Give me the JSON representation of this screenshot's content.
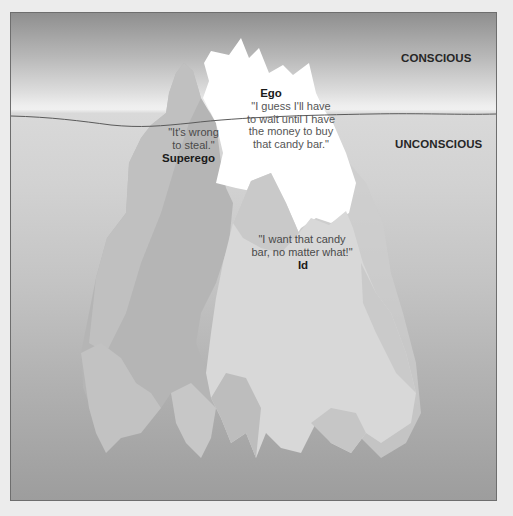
{
  "diagram": {
    "type": "iceberg-model",
    "zones": {
      "conscious": "CONSCIOUS",
      "unconscious": "UNCONSCIOUS"
    },
    "components": {
      "ego": {
        "name": "Ego",
        "quote": "\"I guess I'll  have\nto wait until I have\nthe money  to buy\nthat candy bar.\""
      },
      "superego": {
        "name": "Superego",
        "quote": "\"It's wrong\nto steal.\""
      },
      "id": {
        "name": "Id",
        "quote": "\"I want that candy\nbar, no matter what!\""
      }
    },
    "colors": {
      "sky_top": "#8f8f8f",
      "waterline_bright": "#f0f0f0",
      "water_bottom": "#9d9d9d",
      "ego_ice": "#ffffff",
      "superego_ice": "#b5b5b5",
      "id_ice": "#d6d6d6",
      "waterline": "#5a5a5a",
      "border": "#6e6e6e"
    }
  }
}
